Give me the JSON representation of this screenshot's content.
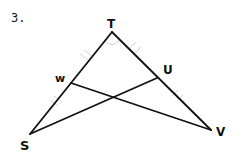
{
  "problem": {
    "number": "3."
  },
  "figure": {
    "points": {
      "T": {
        "label": "T",
        "x": 112,
        "y": 32
      },
      "W": {
        "label": "w",
        "x": 71,
        "y": 83
      },
      "U": {
        "label": "U",
        "x": 157,
        "y": 78
      },
      "S": {
        "label": "S",
        "x": 30,
        "y": 134
      },
      "V": {
        "label": "V",
        "x": 211,
        "y": 130
      }
    },
    "segments": [
      "TS",
      "TV",
      "WV",
      "US"
    ],
    "intersection": {
      "x": 114,
      "y": 97
    },
    "markings": {
      "congruent_ticks": [
        "TW",
        "WS",
        "TU",
        "UV"
      ],
      "angle_arc": "T"
    },
    "colors": {
      "stroke": "#111111",
      "faint_marks": "#d4d4d4"
    }
  }
}
